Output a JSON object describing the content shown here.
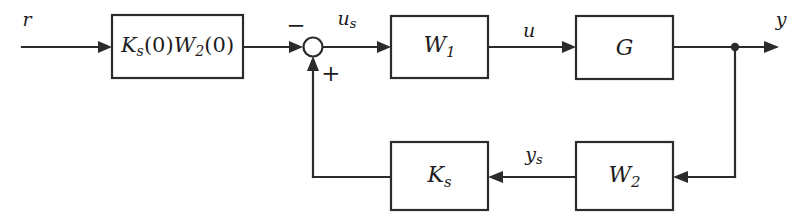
{
  "diagram": {
    "canvas": {
      "width": 808,
      "height": 220,
      "background": "#ffffff"
    },
    "line_color": "#2b2b2b",
    "blocks": [
      {
        "id": "prefilter",
        "label": "Ks(0)W2(0)",
        "label_main": "K",
        "label_sub": "s",
        "x": 112,
        "y": 15,
        "w": 131,
        "h": 63
      },
      {
        "id": "w1",
        "label": "W1",
        "label_main": "W",
        "label_sub": "1",
        "x": 391,
        "y": 16,
        "w": 97,
        "h": 62
      },
      {
        "id": "g",
        "label": "G",
        "label_main": "G",
        "label_sub": "",
        "x": 576,
        "y": 16,
        "w": 97,
        "h": 63
      },
      {
        "id": "ks",
        "label": "Ks",
        "label_main": "K",
        "label_sub": "s",
        "x": 391,
        "y": 142,
        "w": 97,
        "h": 68
      },
      {
        "id": "w2",
        "label": "W2",
        "label_main": "W",
        "label_sub": "2",
        "x": 576,
        "y": 142,
        "w": 97,
        "h": 68
      }
    ],
    "signals": [
      {
        "id": "r",
        "label_main": "r",
        "label_sub": "",
        "x": 27,
        "y": 19
      },
      {
        "id": "us",
        "label_main": "u",
        "label_sub": "s",
        "x": 347,
        "y": 20
      },
      {
        "id": "u",
        "label_main": "u",
        "label_sub": "",
        "x": 529,
        "y": 30
      },
      {
        "id": "y",
        "label_main": "y",
        "label_sub": "",
        "x": 781,
        "y": 19
      },
      {
        "id": "ys",
        "label_main": "y",
        "label_sub": "s",
        "x": 534,
        "y": 156
      }
    ],
    "summing_junction": {
      "id": "sum",
      "cx": 313,
      "cy": 47,
      "r": 9.5,
      "minus_sign": "−",
      "minus_x": 296,
      "minus_y": 25,
      "plus_sign": "+",
      "plus_x": 331,
      "plus_y": 73
    },
    "tap_node": {
      "id": "output-tap",
      "cx": 735,
      "cy": 47,
      "r": 4.2
    }
  }
}
